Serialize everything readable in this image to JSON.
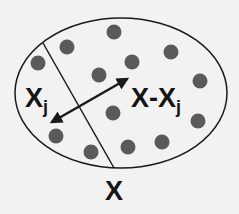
{
  "diagram": {
    "set_label": "X",
    "subset_label": "X",
    "subset_sub": "j",
    "complement_label": "X-X",
    "complement_sub": "j",
    "colors": {
      "background": "#f2f2f2",
      "stroke": "#1a1a1a",
      "dot": "#5a5a5a"
    },
    "dots": [
      [
        114,
        32
      ],
      [
        67,
        47
      ],
      [
        38,
        63
      ],
      [
        132,
        62
      ],
      [
        171,
        52
      ],
      [
        99,
        75
      ],
      [
        200,
        81
      ],
      [
        113,
        113
      ],
      [
        198,
        121
      ],
      [
        56,
        136
      ],
      [
        162,
        142
      ],
      [
        128,
        147
      ],
      [
        91,
        152
      ]
    ]
  }
}
